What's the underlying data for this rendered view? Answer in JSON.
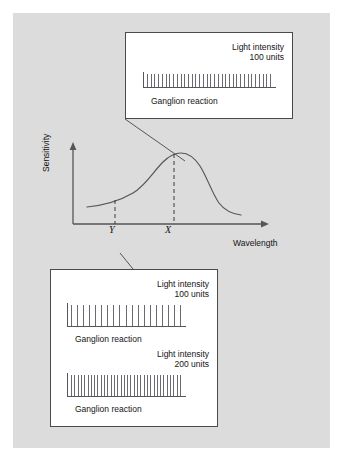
{
  "figure": {
    "type": "scientific-diagram",
    "background_color": "#dcdcdc",
    "page_color": "#ffffff",
    "line_color": "#55555a",
    "text_color": "#141414"
  },
  "graph": {
    "y_axis_label": "Sensitivity",
    "x_axis_label": "Wavelength",
    "tick_labels": [
      {
        "id": "y",
        "text": "Y"
      },
      {
        "id": "x",
        "text": "X"
      }
    ]
  },
  "callouts": [
    {
      "id": "top",
      "position": "top",
      "connects_to": "X",
      "panels": [
        {
          "intensity_line1": "Light intensity",
          "intensity_line2": "100 units",
          "caption": "Ganglion reaction",
          "spike_count": 34,
          "density": "dense"
        }
      ]
    },
    {
      "id": "bottom",
      "position": "bottom",
      "connects_to": "Y",
      "panels": [
        {
          "intensity_line1": "Light intensity",
          "intensity_line2": "100 units",
          "caption": "Ganglion reaction",
          "spike_count": 19,
          "density": "sparse"
        },
        {
          "intensity_line1": "Light intensity",
          "intensity_line2": "200 units",
          "caption": "Ganglion reaction",
          "spike_count": 34,
          "density": "dense"
        }
      ]
    }
  ],
  "chart_data": {
    "type": "line",
    "title": "",
    "xlabel": "Wavelength",
    "ylabel": "Sensitivity",
    "grid": false,
    "legend": "none",
    "axis_arrows": true,
    "annotations": [
      {
        "label": "Y",
        "x": 0.3,
        "note": "sub-peak wavelength, dashed drop line"
      },
      {
        "label": "X",
        "x": 0.52,
        "note": "peak wavelength, dashed drop line"
      }
    ],
    "series": [
      {
        "name": "Spectral sensitivity",
        "x": [
          0.06,
          0.14,
          0.22,
          0.3,
          0.38,
          0.44,
          0.48,
          0.52,
          0.56,
          0.62,
          0.68,
          0.74,
          0.8,
          0.86
        ],
        "y": [
          0.22,
          0.25,
          0.31,
          0.4,
          0.58,
          0.78,
          0.9,
          0.95,
          0.93,
          0.78,
          0.52,
          0.32,
          0.22,
          0.18
        ]
      }
    ]
  }
}
